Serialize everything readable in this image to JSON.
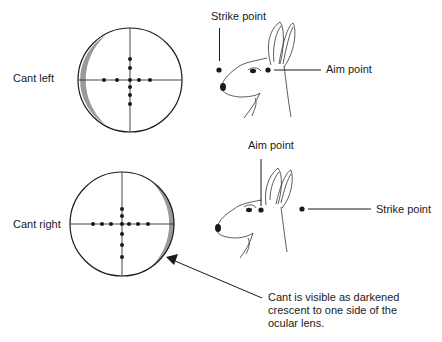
{
  "labels": {
    "cant_left": "Cant left",
    "cant_right": "Cant right",
    "top_strike_point": "Strike point",
    "top_aim_point": "Aim point",
    "bottom_aim_point": "Aim point",
    "bottom_strike_point": "Strike point",
    "note_line1": "Cant is visible as darkened",
    "note_line2": "crescent to one side of the",
    "note_line3": "ocular lens."
  },
  "colors": {
    "stroke": "#1a1a1a",
    "crescent": "#9a9a9a",
    "background": "#ffffff"
  }
}
